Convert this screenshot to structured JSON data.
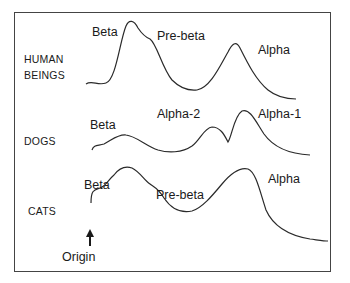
{
  "diagram": {
    "type": "electrophoresis-lipoprotein-profiles",
    "rows": [
      {
        "species": "HUMAN BEINGS",
        "species_lines": [
          "HUMAN",
          "BEINGS"
        ],
        "peaks": [
          "Beta",
          "Pre-beta",
          "Alpha"
        ]
      },
      {
        "species": "DOGS",
        "peaks": [
          "Beta",
          "Alpha-2",
          "Alpha-1"
        ]
      },
      {
        "species": "CATS",
        "peaks": [
          "Beta",
          "Pre-beta",
          "Alpha"
        ]
      }
    ],
    "origin_label": "Origin",
    "colors": {
      "line": "#2a2a2a",
      "frame": "#444444",
      "text": "#1a1a1a"
    }
  }
}
